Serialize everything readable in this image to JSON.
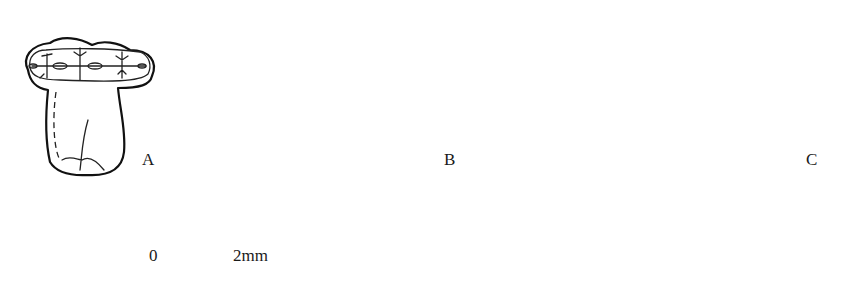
{
  "figure": {
    "panels": [
      {
        "id": "A",
        "label": "A",
        "description": "occlusal-view tooth outline with cusp pattern"
      },
      {
        "id": "B",
        "label": "B",
        "description": "hatched shaded tooth drawing, crown with root"
      },
      {
        "id": "C",
        "label": "C",
        "description": "line drawing of molar crown with roots"
      }
    ],
    "scale_bar": {
      "start_label": "0",
      "end_label": "2mm"
    }
  },
  "colors": {
    "background": "#ffffff",
    "ink": "#111111"
  }
}
